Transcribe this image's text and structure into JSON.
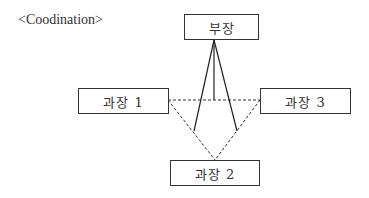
{
  "diagram": {
    "title": "<Coodination>",
    "nodes": {
      "manager": {
        "label": "부장"
      },
      "section_chief_1": {
        "label": "과장 1"
      },
      "section_chief_2": {
        "label": "과장 2"
      },
      "section_chief_3": {
        "label": "과장 3"
      }
    },
    "edges": [
      {
        "from": "manager",
        "to": "section_chief_1",
        "style": "solid"
      },
      {
        "from": "manager",
        "to": "section_chief_2",
        "style": "solid"
      },
      {
        "from": "manager",
        "to": "section_chief_3",
        "style": "solid"
      },
      {
        "from": "section_chief_1",
        "to": "section_chief_3",
        "style": "dashed"
      },
      {
        "from": "section_chief_1",
        "to": "section_chief_2",
        "style": "dashed"
      },
      {
        "from": "section_chief_3",
        "to": "section_chief_2",
        "style": "dashed"
      }
    ]
  }
}
